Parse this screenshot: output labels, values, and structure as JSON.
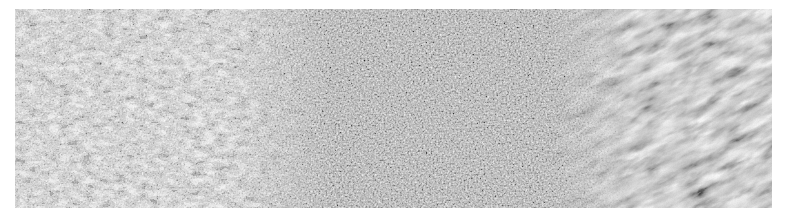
{
  "image": {
    "kind": "grayscale micrograph",
    "description": "Metallographic microstructure transition: coarse ferrite-pearlite (left), fine-grained zone (middle), coarse columnar grains (right)",
    "colors": {
      "background": "#ffffff",
      "light_phase": "#f2f2f2",
      "mid_gray": "#9a9a9a",
      "dark_phase": "#2a2a2a"
    },
    "regions": [
      {
        "name": "coarse-left-zone",
        "x_range": [
          15,
          260
        ]
      },
      {
        "name": "fine-grain-middle-zone",
        "x_range": [
          260,
          560
        ]
      },
      {
        "name": "coarse-columnar-right-zone",
        "x_range": [
          560,
          772
        ]
      }
    ]
  }
}
